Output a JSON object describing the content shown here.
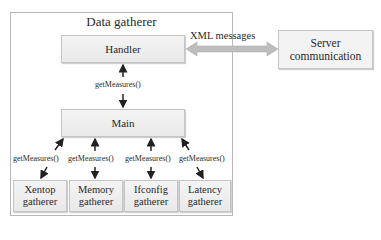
{
  "diagram": {
    "container_title": "Data gatherer",
    "nodes": {
      "handler": "Handler",
      "main": "Main",
      "server_line1": "Server",
      "server_line2": "communication",
      "gatherers": [
        {
          "line1": "Xentop",
          "line2": "gatherer"
        },
        {
          "line1": "Memory",
          "line2": "gatherer"
        },
        {
          "line1": "Ifconfig",
          "line2": "gatherer"
        },
        {
          "line1": "Latency",
          "line2": "gatherer"
        }
      ]
    },
    "edges": {
      "handler_server": "XML messages",
      "handler_main": "getMeasures()",
      "main_gatherers": [
        "getMeasures()",
        "getMeasures()",
        "getMeasures()",
        "getMeasures()"
      ]
    },
    "colors": {
      "box_fill": "#eeeeee",
      "box_border": "#c4c4c4",
      "container_border": "#b8b8b8",
      "arrow": "#222222",
      "double_arrow": "#bdbdbd"
    }
  }
}
